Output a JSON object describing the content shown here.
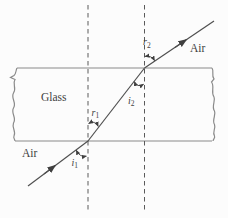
{
  "figure": {
    "background": "#fcfcfc",
    "ray_color": "#4f4f4f",
    "glass_edge_color": "#8a8a8a",
    "normal_style": "dashed",
    "labels": {
      "air_top": "Air",
      "air_bottom": "Air",
      "glass": "Glass",
      "angle_i1": {
        "base": "i",
        "sub": "1"
      },
      "angle_r1": {
        "base": "r",
        "sub": "1"
      },
      "angle_i2": {
        "base": "i",
        "sub": "2"
      },
      "angle_r2": {
        "base": "r",
        "sub": "2"
      }
    }
  }
}
